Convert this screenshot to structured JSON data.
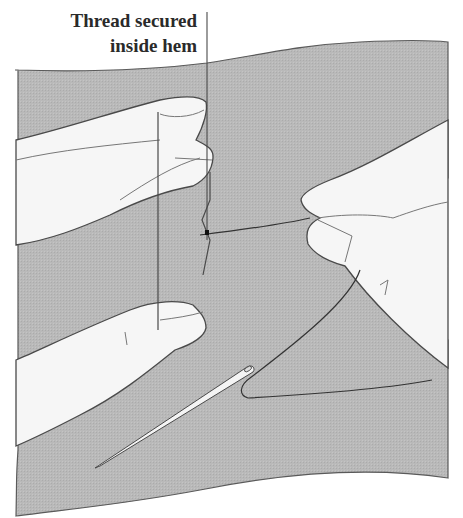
{
  "illustration": {
    "subject": "Hand sewing a hem with needle and thread",
    "callout": {
      "lines": [
        "Thread secured",
        "inside hem"
      ]
    },
    "colors": {
      "fabric": "#b8b8b8",
      "fabric_texture": "#a9a9a9",
      "outline": "#4a4a4a",
      "skin": "#f7f7f7",
      "thread": "#2e2e2e",
      "background": "#ffffff"
    }
  }
}
